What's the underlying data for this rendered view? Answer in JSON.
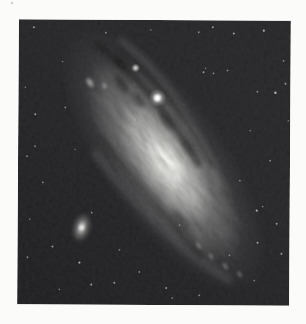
{
  "page": {
    "background": "#fbfbfa",
    "width": 306,
    "height": 324
  },
  "photo": {
    "x": 18,
    "y": 20,
    "width": 272,
    "height": 285,
    "rotation": 0.35,
    "background": "#27272a",
    "corner_shade_opacity": 0.2
  },
  "galaxy": {
    "label": "andromeda-spiral-galaxy",
    "cx": 164,
    "cy": 160,
    "angle": 54.5,
    "layers": [
      {
        "rx": 155,
        "ry": 62,
        "color": "#8f8f8d",
        "center_opacity": 0.5,
        "dx": 0
      },
      {
        "rx": 118,
        "ry": 46,
        "color": "#aeaeac",
        "center_opacity": 0.8,
        "dx": 0
      },
      {
        "rx": 72,
        "ry": 29,
        "color": "#dededa",
        "center_opacity": 0.95,
        "dx": 4
      },
      {
        "rx": 34,
        "ry": 16,
        "color": "#f8f8f4",
        "center_opacity": 1,
        "dx": 6
      }
    ],
    "dust_lanes": [
      {
        "path": "M -132,-12 C -85,-28 -30,-30 22,-26",
        "width": 7,
        "opacity": 0.5
      },
      {
        "path": "M -118,-28 C -70,-44 -15,-42 32,-36",
        "width": 4.5,
        "opacity": 0.38
      },
      {
        "path": "M -55,38 C -5,36 45,30 100,26",
        "width": 5,
        "opacity": 0.3
      }
    ],
    "dust_patches": [
      {
        "x": -104,
        "y": -20,
        "rx": 8,
        "ry": 4,
        "opacity": 0.45
      },
      {
        "x": -87,
        "y": -9,
        "rx": 11,
        "ry": 5,
        "opacity": 0.45
      },
      {
        "x": -64,
        "y": -14,
        "rx": 9,
        "ry": 4.5,
        "opacity": 0.4
      },
      {
        "x": -30,
        "y": -24,
        "rx": 10,
        "ry": 4,
        "opacity": 0.35
      },
      {
        "x": 2,
        "y": -27,
        "rx": 9,
        "ry": 3.5,
        "opacity": 0.3
      },
      {
        "x": 60,
        "y": 22,
        "rx": 12,
        "ry": 5,
        "opacity": 0.3
      }
    ],
    "outer_arms": [
      {
        "path": "M -122,-34 C -60,-50 -5,-46 52,-30",
        "width": 7,
        "opacity": 0.22
      },
      {
        "path": "M -45,52 C 15,50 80,40 135,16",
        "width": 8,
        "opacity": 0.2
      }
    ],
    "bright_knots": [
      {
        "x": -106,
        "y": 16,
        "rx": 7,
        "ry": 4,
        "opacity": 0.8
      },
      {
        "x": -95,
        "y": 6,
        "rx": 4.5,
        "ry": 3,
        "opacity": 0.55
      },
      {
        "x": 90,
        "y": 21,
        "rx": 6,
        "ry": 3,
        "opacity": 0.42
      },
      {
        "x": 106,
        "y": 17,
        "rx": 5,
        "ry": 2.8,
        "opacity": 0.42
      },
      {
        "x": 122,
        "y": 11,
        "rx": 5.5,
        "ry": 3,
        "opacity": 0.45
      },
      {
        "x": 137,
        "y": 4,
        "rx": 5,
        "ry": 3,
        "opacity": 0.4
      }
    ],
    "texture": {
      "light_opacity": 0.2,
      "dark_opacity": 0.24
    }
  },
  "companions": {
    "m32_like_star": {
      "cx": 157,
      "cy": 98,
      "core_r": 3.4,
      "glow_r": 9
    },
    "small_star": {
      "cx": 135,
      "cy": 68,
      "core_r": 1.6,
      "glow_r": 4.5
    },
    "m110_galaxy": {
      "cx": 82,
      "cy": 228,
      "rx": 9,
      "ry": 15,
      "angle": 15,
      "core_color": "#e4e4e0"
    }
  },
  "stars": [
    [
      33,
      28,
      1.0,
      0.5
    ],
    [
      62,
      62,
      0.8,
      0.4
    ],
    [
      105,
      33,
      0.9,
      0.45
    ],
    [
      150,
      30,
      0.8,
      0.4
    ],
    [
      198,
      32,
      0.9,
      0.45
    ],
    [
      212,
      27,
      1.0,
      0.5
    ],
    [
      233,
      33,
      1.0,
      0.55
    ],
    [
      263,
      30,
      1.1,
      0.6
    ],
    [
      283,
      60,
      0.9,
      0.45
    ],
    [
      285,
      83,
      1.0,
      0.5
    ],
    [
      275,
      92,
      1.2,
      0.65
    ],
    [
      257,
      91,
      0.9,
      0.5
    ],
    [
      288,
      120,
      0.8,
      0.4
    ],
    [
      250,
      130,
      0.8,
      0.4
    ],
    [
      270,
      160,
      0.9,
      0.45
    ],
    [
      240,
      180,
      0.9,
      0.4
    ],
    [
      263,
      206,
      0.8,
      0.4
    ],
    [
      257,
      210,
      1.1,
      0.6
    ],
    [
      277,
      223,
      1.0,
      0.5
    ],
    [
      258,
      242,
      1.0,
      0.55
    ],
    [
      282,
      253,
      1.0,
      0.5
    ],
    [
      255,
      280,
      0.9,
      0.4
    ],
    [
      230,
      255,
      0.9,
      0.4
    ],
    [
      203,
      72,
      1.0,
      0.5
    ],
    [
      213,
      73,
      0.9,
      0.45
    ],
    [
      205,
      68,
      0.8,
      0.4
    ],
    [
      227,
      70,
      0.9,
      0.45
    ],
    [
      25,
      88,
      0.8,
      0.4
    ],
    [
      35,
      115,
      1.0,
      0.55
    ],
    [
      27,
      157,
      0.9,
      0.45
    ],
    [
      65,
      108,
      0.9,
      0.45
    ],
    [
      35,
      147,
      0.9,
      0.4
    ],
    [
      43,
      183,
      0.9,
      0.45
    ],
    [
      30,
      220,
      0.8,
      0.4
    ],
    [
      28,
      258,
      0.9,
      0.45
    ],
    [
      53,
      247,
      1.0,
      0.5
    ],
    [
      60,
      290,
      0.8,
      0.4
    ],
    [
      80,
      263,
      1.1,
      0.6
    ],
    [
      92,
      285,
      1.0,
      0.55
    ],
    [
      115,
      283,
      1.0,
      0.5
    ],
    [
      140,
      272,
      0.9,
      0.45
    ],
    [
      167,
      288,
      1.0,
      0.5
    ],
    [
      173,
      298,
      0.9,
      0.4
    ],
    [
      200,
      295,
      0.9,
      0.45
    ],
    [
      120,
      250,
      0.9,
      0.4
    ],
    [
      92,
      213,
      0.9,
      0.45
    ],
    [
      75,
      150,
      0.8,
      0.35
    ],
    [
      180,
      225,
      0.8,
      0.35
    ],
    [
      135,
      120,
      0.7,
      0.3
    ]
  ],
  "grain": {
    "speck_opacity": 0.28,
    "soft_opacity": 0.07
  },
  "margin_speck": {
    "x": 12,
    "y": 3,
    "r": 1.2,
    "color": "#b9b9b4",
    "opacity": 0.7
  }
}
